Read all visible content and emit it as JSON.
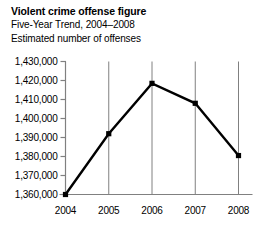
{
  "figure": {
    "title": "Violent crime offense figure",
    "subtitle_line1": "Five-Year Trend, 2004–2008",
    "subtitle_line2": "Estimated number of offenses"
  },
  "chart_data": {
    "type": "line",
    "title": "Violent crime offense figure",
    "subtitle": "Five-Year Trend, 2004–2008",
    "ylabel": "Estimated number of offenses",
    "xlabel": "",
    "categories": [
      "2004",
      "2005",
      "2006",
      "2007",
      "2008"
    ],
    "x": [
      2004,
      2005,
      2006,
      2007,
      2008
    ],
    "values": [
      1360000,
      1392000,
      1418500,
      1408000,
      1380500
    ],
    "series": [
      {
        "name": "Estimated number of offenses",
        "values": [
          1360000,
          1392000,
          1418500,
          1408000,
          1380500
        ]
      }
    ],
    "ylim": [
      1360000,
      1430000
    ],
    "yticks": [
      1360000,
      1370000,
      1380000,
      1390000,
      1400000,
      1410000,
      1420000,
      1430000
    ],
    "ytick_labels": [
      "1,360,000",
      "1,370,000",
      "1,380,000",
      "1,390,000",
      "1,400,000",
      "1,410,000",
      "1,420,000",
      "1,430,000"
    ],
    "xtick_labels": [
      "2004",
      "2005",
      "2006",
      "2007",
      "2008"
    ],
    "grid": "vertical",
    "legend": "none",
    "marker": "square",
    "line_color": "#000000",
    "marker_color": "#000000",
    "grid_color": "#808080",
    "axis_color": "#808080",
    "background": "#ffffff"
  }
}
